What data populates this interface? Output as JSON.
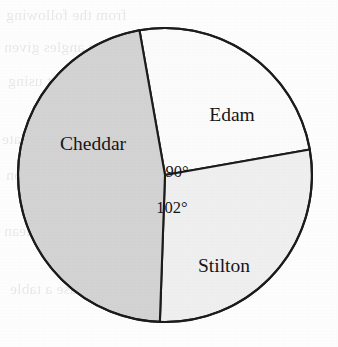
{
  "figure": {
    "kind": "pie-chart",
    "background_color": "#fdfdfd",
    "ghost_text": {
      "note": "faint show-through text from the reverse side of the scanned page",
      "lines": [
        "from the following",
        "measure angles given",
        "in the pie chart using",
        "a protractor. Estimate",
        "a suitable conclusion",
        "calculate and the mean",
        "able and use a table"
      ]
    }
  },
  "chart_data": {
    "type": "pie",
    "title": "",
    "subtitle": "",
    "xlabel": "",
    "ylabel": "",
    "grid": false,
    "legend": "none",
    "labels_inside_slices": true,
    "center": {
      "x": 165,
      "y": 175
    },
    "radius": 147,
    "outline_color": "#1c1c1c",
    "outline_width": 2.1,
    "categories": [
      "Edam",
      "Stilton",
      "Cheddar"
    ],
    "values": [
      90,
      102,
      168
    ],
    "value_unit": "degrees",
    "total_degrees": 360,
    "slices": [
      {
        "name": "Edam",
        "label": "Edam",
        "angle_degrees": 90,
        "angle_label": "90°",
        "angle_label_shown": true,
        "start_degrees": -10,
        "end_degrees": 80,
        "fill": "#fbfbfb",
        "label_x": 232,
        "label_y": 121,
        "angle_label_x": 177,
        "angle_label_y": 177
      },
      {
        "name": "Stilton",
        "label": "Stilton",
        "angle_degrees": 102,
        "angle_label": "102°",
        "angle_label_shown": true,
        "start_degrees": 80,
        "end_degrees": 182,
        "fill": "#efefef",
        "label_x": 224,
        "label_y": 272,
        "angle_label_x": 172,
        "angle_label_y": 213
      },
      {
        "name": "Cheddar",
        "label": "Cheddar",
        "angle_degrees": 168,
        "angle_label": "",
        "angle_label_shown": false,
        "start_degrees": 182,
        "end_degrees": 350,
        "fill": "#d3d3d3",
        "label_x": 93,
        "label_y": 150,
        "angle_label_x": 0,
        "angle_label_y": 0
      }
    ]
  }
}
